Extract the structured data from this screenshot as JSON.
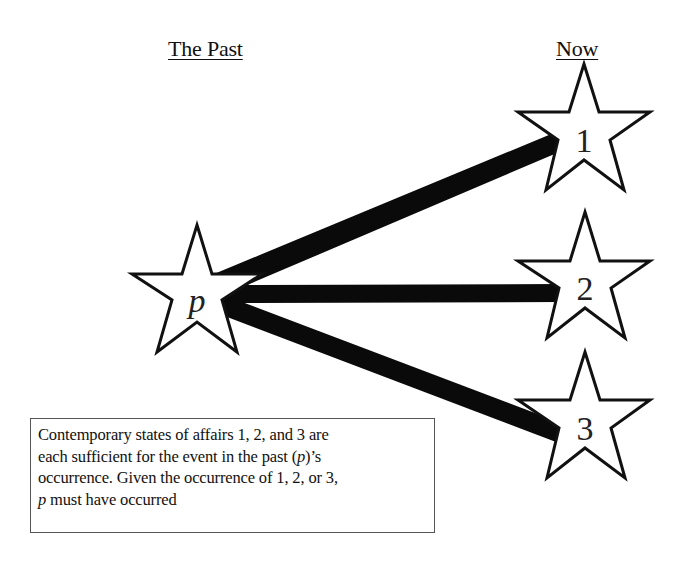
{
  "headings": {
    "past": "The Past",
    "now": "Now"
  },
  "stars": {
    "past": {
      "label": "p",
      "center": [
        197,
        300
      ]
    },
    "now": [
      {
        "label": "1",
        "center": [
          584,
          140
        ]
      },
      {
        "label": "2",
        "center": [
          585,
          288
        ]
      },
      {
        "label": "3",
        "center": [
          585,
          428
        ]
      }
    ]
  },
  "connections": [
    {
      "from": "p",
      "to": "1"
    },
    {
      "from": "p",
      "to": "2"
    },
    {
      "from": "p",
      "to": "3"
    }
  ],
  "note": {
    "line1": "Contemporary states of affairs  1, 2, and 3 are",
    "line2_pre": "each sufficient for the event in the past (",
    "line2_var": "p",
    "line2_post": ")’s",
    "line3": "occurrence. Given  the occurrence of 1, 2, or 3,",
    "line4_var": "p",
    "line4_post": " must have occurred"
  },
  "colors": {
    "stroke": "#111111",
    "fill": "#ffffff",
    "connector": "#0a0a0a"
  }
}
